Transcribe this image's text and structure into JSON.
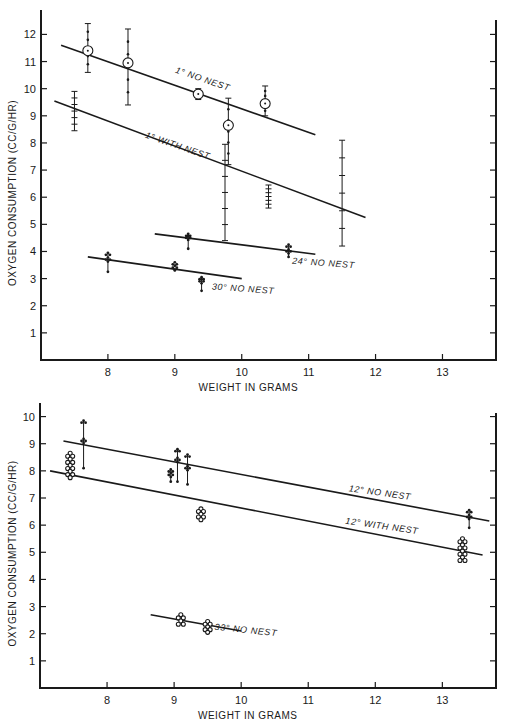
{
  "chart_data": [
    {
      "type": "scatter",
      "title": "",
      "xlabel": "WEIGHT IN GRAMS",
      "ylabel": "OXYGEN CONSUMPTION (CC/G/HR)",
      "xlim": [
        7.0,
        13.8
      ],
      "ylim": [
        0,
        12.9
      ],
      "x_ticks": [
        8,
        9,
        10,
        11,
        12,
        13
      ],
      "y_ticks": [
        1,
        2,
        3,
        4,
        5,
        6,
        7,
        8,
        9,
        10,
        11,
        12
      ],
      "grid": false,
      "frame": {
        "left": 41,
        "right": 496,
        "top": 10,
        "bottom": 360,
        "x0": 7.0,
        "x1": 13.8,
        "y0": 0,
        "y1": 12.9
      },
      "series": [
        {
          "name": "1° NO NEST",
          "label_pos": {
            "x": 9.0,
            "y": 10.6,
            "angle": 19
          },
          "fit_line": {
            "x": [
              7.3,
              11.1
            ],
            "y": [
              11.6,
              8.3
            ]
          },
          "points": [
            {
              "x": 7.7,
              "mean": 11.4,
              "min": 10.6,
              "max": 12.4,
              "marker": "circle"
            },
            {
              "x": 8.3,
              "mean": 10.95,
              "min": 9.4,
              "max": 12.2,
              "marker": "circle"
            },
            {
              "x": 9.35,
              "mean": 9.8,
              "min": 9.6,
              "max": 10.0,
              "marker": "circle"
            },
            {
              "x": 9.8,
              "mean": 8.65,
              "min": 7.2,
              "max": 9.65,
              "marker": "circle"
            },
            {
              "x": 10.35,
              "mean": 9.45,
              "min": 9.0,
              "max": 10.1,
              "marker": "circle"
            }
          ]
        },
        {
          "name": "1° WITH NEST",
          "label_pos": {
            "x": 8.55,
            "y": 8.2,
            "angle": 19
          },
          "fit_line": {
            "x": [
              7.2,
              11.85
            ],
            "y": [
              9.55,
              5.25
            ]
          },
          "points": [
            {
              "x": 7.5,
              "mean": 9.2,
              "min": 8.45,
              "max": 9.9,
              "marker": "bar"
            },
            {
              "x": 9.75,
              "mean": 7.1,
              "min": 4.4,
              "max": 7.95,
              "marker": "bar"
            },
            {
              "x": 10.4,
              "mean": 6.2,
              "min": 5.6,
              "max": 6.45,
              "marker": "bar"
            },
            {
              "x": 11.5,
              "mean": 5.8,
              "min": 4.2,
              "max": 8.1,
              "marker": "bar"
            }
          ]
        },
        {
          "name": "24° NO NEST",
          "label_pos": {
            "x": 10.75,
            "y": 3.55,
            "angle": 4
          },
          "fit_line": {
            "x": [
              8.7,
              11.1
            ],
            "y": [
              4.65,
              3.9
            ]
          },
          "points": [
            {
              "x": 9.2,
              "mean": 4.5,
              "min": 4.1,
              "max": 4.65,
              "marker": "dots"
            },
            {
              "x": 10.7,
              "mean": 4.0,
              "min": 3.8,
              "max": 4.25,
              "marker": "dots"
            }
          ]
        },
        {
          "name": "30° NO NEST",
          "label_pos": {
            "x": 9.55,
            "y": 2.6,
            "angle": 4
          },
          "fit_line": {
            "x": [
              7.7,
              10.0
            ],
            "y": [
              3.8,
              3.0
            ]
          },
          "points": [
            {
              "x": 8.0,
              "mean": 3.7,
              "min": 3.25,
              "max": 3.95,
              "marker": "dots"
            },
            {
              "x": 9.0,
              "mean": 3.4,
              "min": 3.3,
              "max": 3.6,
              "marker": "dots"
            },
            {
              "x": 9.4,
              "mean": 2.9,
              "min": 2.55,
              "max": 3.05,
              "marker": "dots"
            }
          ]
        }
      ]
    },
    {
      "type": "scatter",
      "title": "",
      "xlabel": "WEIGHT IN GRAMS",
      "ylabel": "OXYGEN CONSUMPTION (CC/G/HR)",
      "xlim": [
        7.0,
        13.8
      ],
      "ylim": [
        0,
        10.5
      ],
      "x_ticks": [
        8,
        9,
        10,
        11,
        12,
        13
      ],
      "y_ticks": [
        1,
        2,
        3,
        4,
        5,
        6,
        7,
        8,
        9,
        10
      ],
      "grid": false,
      "frame": {
        "left": 40,
        "right": 496,
        "top": 403,
        "bottom": 688,
        "x0": 7.0,
        "x1": 13.8,
        "y0": 0,
        "y1": 10.5
      },
      "series": [
        {
          "name": "12° NO NEST",
          "label_pos": {
            "x": 11.6,
            "y": 7.25,
            "angle": 8
          },
          "fit_line": {
            "x": [
              7.35,
              13.7
            ],
            "y": [
              9.1,
              6.15
            ]
          },
          "points": [
            {
              "x": 7.65,
              "mean": 9.1,
              "min": 8.1,
              "max": 9.85,
              "marker": "dots"
            },
            {
              "x": 8.95,
              "mean": 7.85,
              "min": 7.6,
              "max": 8.05,
              "marker": "dots"
            },
            {
              "x": 9.05,
              "mean": 8.4,
              "min": 7.6,
              "max": 8.8,
              "marker": "dots"
            },
            {
              "x": 9.2,
              "mean": 8.1,
              "min": 7.5,
              "max": 8.6,
              "marker": "dots"
            },
            {
              "x": 13.4,
              "mean": 6.3,
              "min": 5.9,
              "max": 6.55,
              "marker": "dots"
            }
          ]
        },
        {
          "name": "12° WITH NEST",
          "label_pos": {
            "x": 11.55,
            "y": 6.05,
            "angle": 8
          },
          "fit_line": {
            "x": [
              7.15,
              13.6
            ],
            "y": [
              8.0,
              4.9
            ]
          },
          "points": [
            {
              "x": 7.45,
              "mean": 8.1,
              "min": 7.75,
              "max": 8.65,
              "marker": "open"
            },
            {
              "x": 9.4,
              "mean": 6.4,
              "min": 6.2,
              "max": 6.6,
              "marker": "open"
            },
            {
              "x": 13.3,
              "mean": 5.3,
              "min": 4.7,
              "max": 5.5,
              "marker": "open"
            }
          ]
        },
        {
          "name": "33° NO NEST",
          "label_pos": {
            "x": 9.6,
            "y": 2.15,
            "angle": 6
          },
          "fit_line": {
            "x": [
              8.65,
              10.0
            ],
            "y": [
              2.7,
              2.1
            ]
          },
          "points": [
            {
              "x": 9.1,
              "mean": 2.5,
              "min": 2.35,
              "max": 2.7,
              "marker": "open"
            },
            {
              "x": 9.5,
              "mean": 2.3,
              "min": 2.05,
              "max": 2.45,
              "marker": "open"
            }
          ]
        }
      ]
    }
  ],
  "figure": {
    "panels": [
      {
        "ylabel": "OXYGEN CONSUMPTION (CC/G/HR)",
        "xlabel": "WEIGHT IN GRAMS"
      },
      {
        "ylabel": "OXYGEN CONSUMPTION (CC/G/HR)",
        "xlabel": "WEIGHT IN GRAMS"
      }
    ]
  }
}
